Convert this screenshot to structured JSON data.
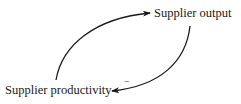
{
  "diagram": {
    "type": "causal-loop",
    "nodes": [
      {
        "id": "output",
        "label": "Supplier output"
      },
      {
        "id": "productivity",
        "label": "Supplier productivity"
      }
    ],
    "edges": [
      {
        "from": "productivity",
        "to": "output",
        "polarity": ""
      },
      {
        "from": "output",
        "to": "productivity",
        "polarity": "−"
      }
    ],
    "colors": {
      "stroke": "#1a1a1a",
      "text": "#1a1a1a",
      "background": "#ffffff"
    }
  }
}
